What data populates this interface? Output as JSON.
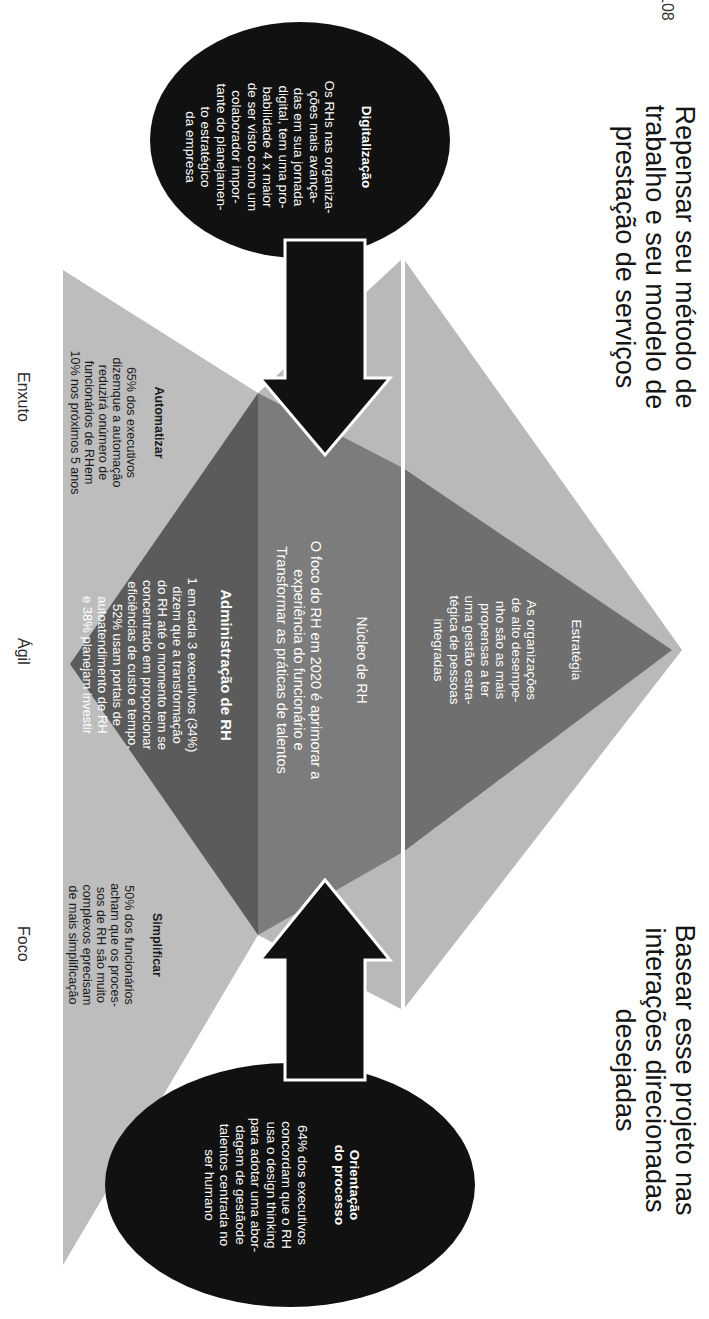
{
  "page": {
    "number": "108"
  },
  "titles": {
    "left": "Repensar seu método de\ntrabalho e seu modelo de\nprestação de serviços",
    "right": "Basear esse projeto nas\ninterações direcionadas\ndesejadas"
  },
  "circles": {
    "digitalizacao": {
      "heading": "Digitalização",
      "body": "Os RHs nas organiza-\nções mais avança-\ndas em sua jornada\ndigital, tem uma pro-\nbabilidade 4 x maior\nde ser visto como um\ncolaborador impor-\ntante do planejamen-\nto estratégico\nda empresa"
    },
    "orientacao": {
      "heading": "Orientação\ndo processo",
      "body": "64% dos executivos\nconcordam que o RH\nusa o design thinking\npara adotar uma abor-\ndagem de gestãode\ntalentos centrada no\nser humano"
    }
  },
  "sections": {
    "estrategia": {
      "heading": "Estratégia",
      "body": "As organizações\nde alto desempe-\nnho são as mais\npropensas a ter\numa gestão estra-\ntégica de pessoas\nintegradas"
    },
    "nucleo": {
      "heading": "Núcleo de RH",
      "body": "O foco do RH em 2020 é aprimorar a\nexperiência do funcionário e\nTransformar as práticas de talentos"
    },
    "administracao": {
      "heading": "Administração de RH",
      "body": "1 em cada 3 executivos (34%)\ndizem que a transformação\ndo RH até o momento tem se\nconcentrado em proporcionar\neficiências de custo e tempo,\n52% usam portais de\nautoatendimento de RH\ne 38% planejam investir"
    },
    "automatizar": {
      "heading": "Automatizar",
      "body": "65% dos executivos\ndizemque a automação\nreduzirá onúmero de\nfuncionários de RHem\n10% nos próximos 5 anos"
    },
    "simplificar": {
      "heading": "Simplificar",
      "body": "50% dos funcionários\nacham que os proces-\nsos de RH são muito\ncomplexos eprecisam\nde mais simplificação"
    }
  },
  "axis_labels": [
    "Enxuto",
    "Ágil",
    "Foco"
  ],
  "colors": {
    "light_gray": "#b8b8b8",
    "mid_gray": "#7a7a7a",
    "dark_gray": "#5e5e5e",
    "black": "#111111",
    "white_line": "#ffffff"
  }
}
